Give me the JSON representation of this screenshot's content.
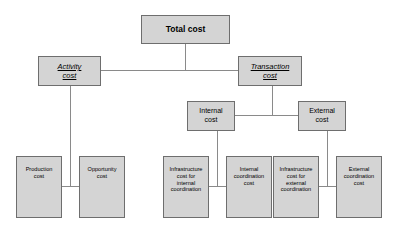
{
  "diagram": {
    "type": "hierarchy-tree",
    "colors": {
      "node_fill": "#d4d4d4",
      "node_border": "#6e6e6e",
      "connector": "#8a8a8a",
      "background": "#ffffff",
      "text": "#000000"
    },
    "nodes": {
      "root": {
        "label": "Total cost"
      },
      "activity_cost": {
        "label": "Activity\ncost"
      },
      "transaction_cost": {
        "label": "Transaction\ncost"
      },
      "internal_cost": {
        "label": "Internal\ncost"
      },
      "external_cost": {
        "label": "External\ncost"
      },
      "production_cost": {
        "label": "Production\ncost"
      },
      "opportunity_cost": {
        "label": "Opportunity\ncost"
      },
      "infrastructure_internal": {
        "label": "Infrastructure\ncost for\ninternal\ncoordination"
      },
      "internal_coordination": {
        "label": "Internal\ncoordination\ncost"
      },
      "infrastructure_external": {
        "label": "Infrastructure\ncost for\nexternal\ncoordination"
      },
      "external_coordination": {
        "label": "External\ncoordination\ncost"
      }
    }
  }
}
